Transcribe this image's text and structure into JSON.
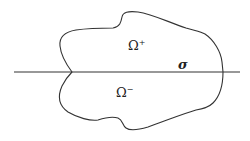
{
  "diagram": {
    "type": "domain-partition",
    "colors": {
      "background": "#ffffff",
      "stroke": "#333333",
      "text": "#222222"
    },
    "labels": {
      "upper_region": {
        "base": "Ω",
        "superscript": "+"
      },
      "lower_region": {
        "base": "Ω",
        "superscript": "−"
      },
      "interface": "σ"
    },
    "elements": [
      {
        "id": "boundary",
        "kind": "closed-curve"
      },
      {
        "id": "interface-line",
        "kind": "horizontal-line",
        "label": "σ"
      },
      {
        "id": "upper-region",
        "kind": "region",
        "label": "Ω+"
      },
      {
        "id": "lower-region",
        "kind": "region",
        "label": "Ω−"
      }
    ]
  }
}
